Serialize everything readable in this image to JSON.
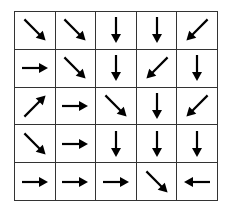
{
  "diagram": {
    "type": "grid-policy",
    "rows": 5,
    "cols": 5,
    "line_color": "#333333",
    "arrow_color": "#000000",
    "cells": [
      [
        "SE",
        "SE",
        "S",
        "S",
        "SW"
      ],
      [
        "E",
        "SE",
        "S",
        "SW",
        "S"
      ],
      [
        "NE",
        "E",
        "SE",
        "S",
        "SW"
      ],
      [
        "SE",
        "E",
        "S",
        "S",
        "S"
      ],
      [
        "E",
        "E",
        "E",
        "SE",
        "W"
      ]
    ]
  }
}
